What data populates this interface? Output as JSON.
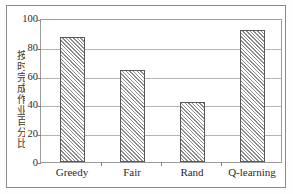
{
  "chart_data": {
    "type": "bar",
    "title": "",
    "xlabel": "",
    "ylabel": "按时完成作业百分比",
    "categories": [
      "Greedy",
      "Fair",
      "Rand",
      "Q-learning"
    ],
    "values": [
      88,
      65,
      42,
      93
    ],
    "ylim": [
      0,
      100
    ],
    "yticks": [
      0,
      20,
      40,
      60,
      80,
      100
    ],
    "ytick_labels": [
      "0",
      "20",
      "40",
      "60",
      "80",
      "100"
    ],
    "grid": true,
    "grid_axis": "y",
    "legend": null,
    "legend_position": "none",
    "bar_style": {
      "fill": "#f7f7f7",
      "hatch": "diagonal-forward",
      "hatch_color": "#8d8d8d",
      "edge_color": "#585858"
    },
    "colors": {
      "axis": "#9b9b9b",
      "gridline": "#b4b4b4",
      "text": "#2b2b2b",
      "frame": "#8a8a8a"
    }
  }
}
